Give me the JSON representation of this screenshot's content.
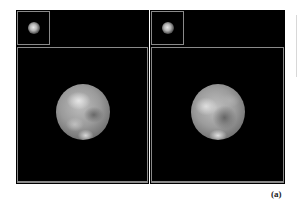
{
  "figure": {
    "label": "(a)",
    "panels": [
      {
        "id": "left",
        "thumbnail": {
          "description": "small blurred planet image"
        },
        "main": {
          "description": "enlarged grayscale planet disk with surface features"
        }
      },
      {
        "id": "right",
        "thumbnail": {
          "description": "small blurred planet image"
        },
        "main": {
          "description": "enlarged grayscale planet disk with surface features"
        }
      }
    ],
    "colors": {
      "background": "#000000",
      "frame": "#8a8a8a",
      "page": "#ffffff"
    }
  }
}
